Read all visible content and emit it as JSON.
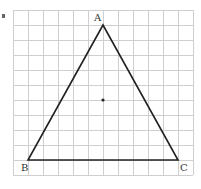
{
  "diagram": {
    "type": "triangle-on-grid",
    "grid": {
      "columns": 12,
      "rows": 11,
      "origin_px": [
        13,
        10
      ],
      "cell_px": 15,
      "line_color": "#cfcfcf"
    },
    "vertices": [
      {
        "label": "A",
        "grid": [
          6,
          1
        ]
      },
      {
        "label": "B",
        "grid": [
          1,
          10
        ]
      },
      {
        "label": "C",
        "grid": [
          11,
          10
        ]
      }
    ],
    "center_point": {
      "grid": [
        6,
        6
      ]
    },
    "stroke_color": "#222222"
  }
}
